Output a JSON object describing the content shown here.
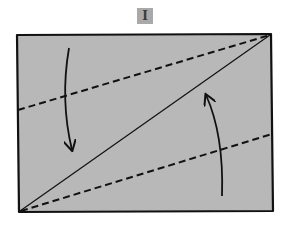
{
  "step": {
    "numeral": "I"
  },
  "colors": {
    "paper_fill": "#b8b8b8",
    "outline": "#111111",
    "badge_fill": "#a9a9a9",
    "background": "#ffffff"
  },
  "diagram": {
    "type": "origami-fold-step",
    "paper_corners": {
      "top_left": [
        17,
        35
      ],
      "top_right": [
        271,
        34
      ],
      "bottom_right": [
        273,
        211
      ],
      "bottom_left": [
        19,
        212
      ]
    },
    "solid_diagonal": {
      "from": [
        19,
        212
      ],
      "to": [
        271,
        34
      ]
    },
    "valley_folds": [
      {
        "name": "upper-dashed-fold",
        "from": [
          18,
          110
        ],
        "to": [
          271,
          35
        ]
      },
      {
        "name": "lower-dashed-fold",
        "from": [
          20,
          211
        ],
        "to": [
          272,
          134
        ]
      }
    ],
    "arrows": [
      {
        "name": "fold-down-arrow",
        "direction": "down",
        "start": [
          69,
          48
        ],
        "end": [
          72,
          150
        ]
      },
      {
        "name": "fold-up-arrow",
        "direction": "up",
        "start": [
          222,
          196
        ],
        "end": [
          206,
          95
        ]
      }
    ]
  }
}
